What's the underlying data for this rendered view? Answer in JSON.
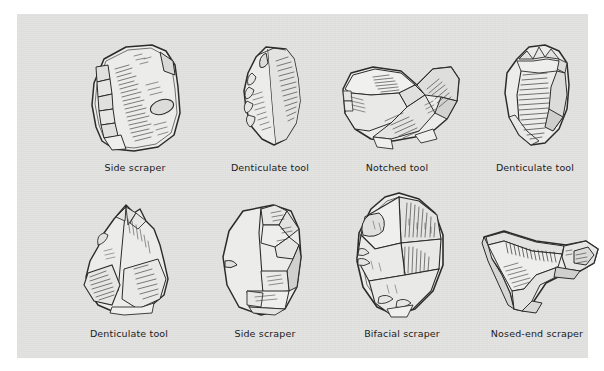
{
  "figure": {
    "kind": "archaeological-illustration-plate",
    "page_background": "#ffffff",
    "panel_background": "#e3e3e1",
    "ink_color": "#2b2b2b",
    "caption_color": "#1b1b1b",
    "rows": 2,
    "columns": 4,
    "items": [
      {
        "index": 0,
        "caption": "Side scraper",
        "row": 1,
        "column": 1,
        "icon": "stone-tool-side-scraper-icon"
      },
      {
        "index": 1,
        "caption": "Denticulate tool",
        "row": 1,
        "column": 2,
        "icon": "stone-tool-denticulate-icon"
      },
      {
        "index": 2,
        "caption": "Notched tool",
        "row": 1,
        "column": 3,
        "icon": "stone-tool-notched-icon"
      },
      {
        "index": 3,
        "caption": "Denticulate tool",
        "row": 1,
        "column": 4,
        "icon": "stone-tool-denticulate-icon"
      },
      {
        "index": 4,
        "caption": "Denticulate tool",
        "row": 2,
        "column": 1,
        "icon": "stone-tool-denticulate-icon"
      },
      {
        "index": 5,
        "caption": "Side scraper",
        "row": 2,
        "column": 2,
        "icon": "stone-tool-side-scraper-icon"
      },
      {
        "index": 6,
        "caption": "Bifacial scraper",
        "row": 2,
        "column": 3,
        "icon": "stone-tool-bifacial-scraper-icon"
      },
      {
        "index": 7,
        "caption": "Nosed-end scraper",
        "row": 2,
        "column": 4,
        "icon": "stone-tool-nosed-end-scraper-icon"
      }
    ]
  }
}
